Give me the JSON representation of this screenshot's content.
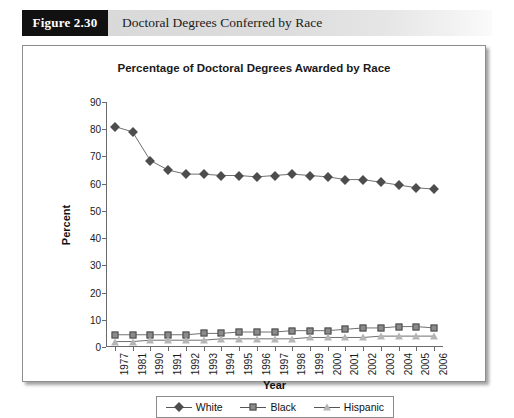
{
  "header": {
    "figure_number": "Figure 2.30",
    "caption": "Doctoral Degrees Conferred by Race"
  },
  "chart_data": {
    "type": "line",
    "title": "Percentage of Doctoral Degrees Awarded by Race",
    "xlabel": "Year",
    "ylabel": "Percent",
    "ylim": [
      0,
      90
    ],
    "yticks": [
      0,
      10,
      20,
      30,
      40,
      50,
      60,
      70,
      80,
      90
    ],
    "grid": false,
    "legend_position": "bottom",
    "categories": [
      "1977",
      "1981",
      "1990",
      "1991",
      "1992",
      "1993",
      "1994",
      "1995",
      "1996",
      "1997",
      "1998",
      "1999",
      "2000",
      "2001",
      "2002",
      "2003",
      "2004",
      "2005",
      "2006"
    ],
    "series": [
      {
        "name": "White",
        "marker": "filled-diamond",
        "color": "#4d4d4d",
        "values": [
          81,
          79,
          68.5,
          65,
          63.5,
          63.5,
          63,
          63,
          62.5,
          63,
          63.5,
          63,
          62.5,
          61.5,
          61.5,
          60.5,
          59.5,
          58.5,
          58
        ]
      },
      {
        "name": "Black",
        "marker": "filled-square",
        "color": "#8a8a8a",
        "values": [
          4.5,
          4.5,
          4.5,
          4.5,
          4.5,
          5,
          5,
          5.5,
          5.5,
          5.5,
          6,
          6,
          6,
          6.5,
          7,
          7,
          7.5,
          7.5,
          7
        ]
      },
      {
        "name": "Hispanic",
        "marker": "open-triangle",
        "color": "#b5b5b5",
        "values": [
          2,
          2,
          2.5,
          2.5,
          2.5,
          2.5,
          3,
          3,
          3,
          3,
          3,
          3.5,
          3.5,
          3.5,
          3.5,
          4,
          4,
          4,
          4
        ]
      }
    ]
  }
}
